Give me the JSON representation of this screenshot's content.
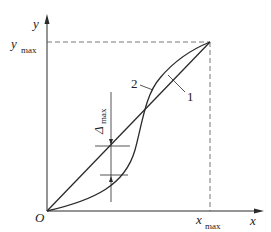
{
  "diagram": {
    "axes": {
      "x_label": "x",
      "y_label": "y",
      "origin_label": "O",
      "x_max_label": "x",
      "x_max_sub": "max",
      "y_max_label": "y",
      "y_max_sub": "max"
    },
    "curves": [
      {
        "id": "1",
        "label": "1",
        "description": "straight line from origin to (x_max, y_max)"
      },
      {
        "id": "2",
        "label": "2",
        "description": "S-shaped curve crossing line 1"
      }
    ],
    "deviation": {
      "label": "Δ",
      "sub": "max"
    },
    "colors": {
      "line": "#2a2a2a",
      "dash": "#555555",
      "background": "#ffffff"
    }
  }
}
